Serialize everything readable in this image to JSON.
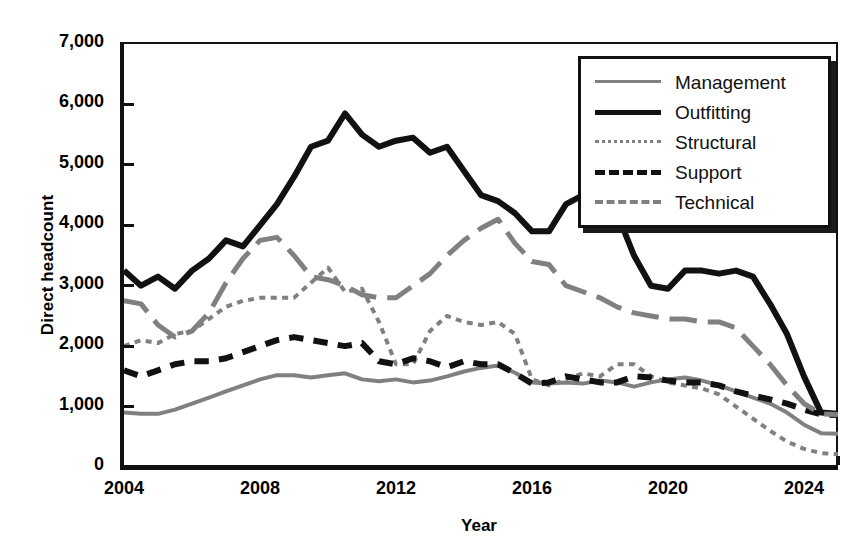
{
  "chart_data": {
    "type": "line",
    "title": "",
    "xlabel": "Year",
    "ylabel": "Direct headcount",
    "xlim": [
      2004,
      2025
    ],
    "ylim": [
      0,
      7000
    ],
    "grid": false,
    "legend_position": "top-right",
    "ytick_labels": [
      "0",
      "1,000",
      "2,000",
      "3,000",
      "4,000",
      "5,000",
      "6,000",
      "7,000"
    ],
    "ytick_values": [
      0,
      1000,
      2000,
      3000,
      4000,
      5000,
      6000,
      7000
    ],
    "xtick_labels": [
      "2004",
      "2008",
      "2012",
      "2016",
      "2020",
      "2024"
    ],
    "xtick_values": [
      2004,
      2008,
      2012,
      2016,
      2020,
      2024
    ],
    "x_minor_tick_step": 1,
    "x": [
      2004,
      2004.5,
      2005,
      2005.5,
      2006,
      2006.5,
      2007,
      2007.5,
      2008,
      2008.5,
      2009,
      2009.5,
      2010,
      2010.5,
      2011,
      2011.5,
      2012,
      2012.5,
      2013,
      2013.5,
      2014,
      2014.5,
      2015,
      2015.5,
      2016,
      2016.5,
      2017,
      2017.5,
      2018,
      2018.5,
      2019,
      2019.5,
      2020,
      2020.5,
      2021,
      2021.5,
      2022,
      2022.5,
      2023,
      2023.5,
      2024,
      2024.5,
      2025
    ],
    "series": [
      {
        "name": "Management",
        "color": "#808080",
        "style": "solid",
        "width": 4,
        "values": [
          900,
          880,
          880,
          950,
          1050,
          1150,
          1250,
          1350,
          1450,
          1520,
          1520,
          1480,
          1520,
          1550,
          1450,
          1420,
          1450,
          1400,
          1430,
          1500,
          1580,
          1640,
          1680,
          1560,
          1400,
          1380,
          1400,
          1380,
          1430,
          1400,
          1330,
          1400,
          1450,
          1480,
          1430,
          1350,
          1250,
          1150,
          1050,
          900,
          700,
          560,
          550
        ]
      },
      {
        "name": "Outfitting",
        "color": "#111111",
        "style": "solid",
        "width": 6,
        "values": [
          3250,
          3000,
          3150,
          2950,
          3250,
          3450,
          3750,
          3650,
          4000,
          4350,
          4800,
          5300,
          5400,
          5850,
          5500,
          5300,
          5400,
          5450,
          5200,
          5300,
          4900,
          4500,
          4400,
          4200,
          3900,
          3900,
          4350,
          4500,
          4600,
          4200,
          3500,
          3000,
          2950,
          3250,
          3250,
          3200,
          3250,
          3150,
          2700,
          2200,
          1500,
          900,
          880
        ]
      },
      {
        "name": "Structural",
        "color": "#808080",
        "style": "dotted",
        "width": 4,
        "values": [
          2000,
          2100,
          2050,
          2200,
          2250,
          2450,
          2650,
          2750,
          2800,
          2800,
          2800,
          3050,
          3300,
          2900,
          2950,
          2400,
          1700,
          1700,
          2250,
          2500,
          2400,
          2350,
          2400,
          2200,
          1450,
          1350,
          1450,
          1550,
          1500,
          1700,
          1700,
          1500,
          1400,
          1350,
          1300,
          1200,
          1000,
          800,
          600,
          420,
          300,
          230,
          210
        ]
      },
      {
        "name": "Support",
        "color": "#111111",
        "style": "dashed",
        "width": 6,
        "values": [
          1600,
          1500,
          1600,
          1700,
          1750,
          1750,
          1800,
          1900,
          2000,
          2100,
          2150,
          2100,
          2050,
          2000,
          2050,
          1750,
          1700,
          1800,
          1750,
          1650,
          1750,
          1700,
          1700,
          1550,
          1380,
          1400,
          1500,
          1450,
          1400,
          1400,
          1500,
          1480,
          1430,
          1400,
          1400,
          1350,
          1250,
          1180,
          1120,
          1050,
          950,
          870,
          860
        ]
      },
      {
        "name": "Technical",
        "color": "#808080",
        "style": "longdash",
        "width": 5,
        "values": [
          2750,
          2700,
          2350,
          2150,
          2250,
          2550,
          3050,
          3450,
          3750,
          3800,
          3500,
          3150,
          3100,
          3000,
          2850,
          2800,
          2800,
          3000,
          3200,
          3500,
          3750,
          3950,
          4100,
          3700,
          3400,
          3350,
          3000,
          2900,
          2800,
          2650,
          2550,
          2500,
          2450,
          2450,
          2400,
          2400,
          2300,
          2000,
          1700,
          1350,
          1050,
          880,
          870
        ]
      }
    ]
  },
  "legend": {
    "items": [
      {
        "label": "Management"
      },
      {
        "label": "Outfitting"
      },
      {
        "label": "Structural"
      },
      {
        "label": "Support"
      },
      {
        "label": "Technical"
      }
    ]
  }
}
